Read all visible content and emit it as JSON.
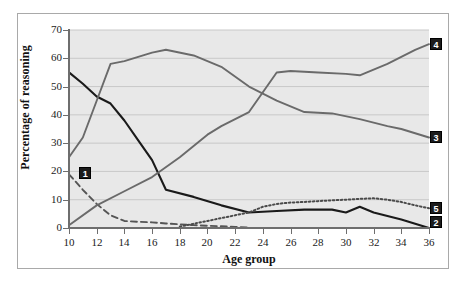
{
  "chart_data": {
    "type": "line",
    "title": "",
    "xlabel": "Age group",
    "ylabel": "Percentage of reasoning",
    "xlim": [
      10,
      36
    ],
    "ylim": [
      0,
      70
    ],
    "grid": true,
    "legend_position": "line-end-labels",
    "x_ticks": [
      10,
      12,
      14,
      16,
      18,
      20,
      22,
      24,
      26,
      28,
      30,
      32,
      34,
      36
    ],
    "y_ticks": [
      0,
      10,
      20,
      30,
      40,
      50,
      60,
      70
    ],
    "series": [
      {
        "name": "1",
        "label": "1",
        "style": "dashed",
        "color": "#555555",
        "x": [
          10,
          11,
          12,
          13,
          14,
          15,
          16,
          17,
          18,
          19,
          20,
          21,
          22,
          23
        ],
        "values": [
          19,
          13.5,
          8.5,
          4.5,
          2.5,
          2.2,
          2.0,
          1.6,
          1.3,
          1.0,
          0.8,
          0.6,
          0.4,
          0.2
        ]
      },
      {
        "name": "2",
        "label": "2",
        "style": "solid-black",
        "color": "#1a1a1a",
        "x": [
          10,
          11,
          12,
          13,
          14,
          15,
          16,
          17,
          19,
          21,
          23,
          25,
          27,
          29,
          30,
          31,
          32,
          34,
          36
        ],
        "values": [
          55,
          51,
          46.5,
          44,
          38,
          31,
          24,
          13.5,
          11,
          8,
          5.5,
          6,
          6.5,
          6.5,
          5.5,
          7.5,
          5.5,
          3,
          0
        ]
      },
      {
        "name": "3",
        "label": "3",
        "style": "solid-gray",
        "color": "#6a6a6a",
        "x": [
          10,
          11,
          12,
          13,
          14,
          16,
          17,
          19,
          21,
          23,
          25,
          27,
          29,
          31,
          33,
          34,
          36
        ],
        "values": [
          25,
          32,
          45,
          58,
          59,
          62,
          63,
          61,
          57,
          50,
          45,
          41,
          40.5,
          38.5,
          36,
          35,
          32
        ]
      },
      {
        "name": "4",
        "label": "4",
        "style": "solid-gray",
        "color": "#6a6a6a",
        "x": [
          10,
          12,
          14,
          16,
          18,
          20,
          21,
          23,
          25,
          26,
          28,
          30,
          31,
          33,
          35,
          36
        ],
        "values": [
          1,
          8,
          13,
          18,
          25,
          33,
          36,
          41,
          55,
          55.5,
          55,
          54.5,
          54,
          58,
          63,
          65
        ]
      },
      {
        "name": "5",
        "label": "5",
        "style": "dotted",
        "color": "#4a4a4a",
        "x": [
          18,
          19,
          20,
          21,
          22,
          23,
          24,
          25,
          26,
          27,
          28,
          29,
          30,
          31,
          32,
          33,
          34,
          35,
          36
        ],
        "values": [
          0.5,
          1.5,
          2.5,
          3.5,
          4.5,
          5.5,
          7.5,
          8.5,
          9,
          9.2,
          9.5,
          9.8,
          10,
          10.3,
          10.5,
          10,
          9.2,
          8,
          7
        ]
      }
    ]
  },
  "colors": {
    "plot_background": "#e8e8e8",
    "grid_line": "#c8c8c8",
    "axis": "#6e6e6e",
    "frame": "#a9a9a9",
    "tag_background": "#1c1c1c",
    "tag_text": "#ffffff"
  }
}
